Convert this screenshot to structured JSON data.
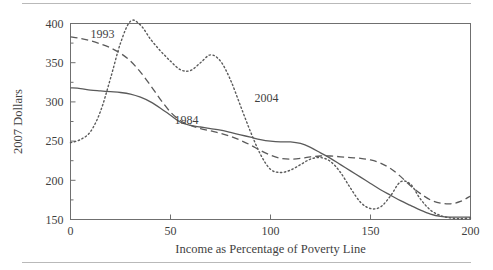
{
  "figure": {
    "name": "poverty-line-income-chart",
    "top_rule": true,
    "bottom_rule": true
  },
  "chart_data": {
    "type": "line",
    "title": "",
    "xlabel": "Income as Percentage of Poverty Line",
    "ylabel": "2007 Dollars",
    "xlim": [
      0,
      200
    ],
    "ylim": [
      150,
      400
    ],
    "xticks": [
      0,
      50,
      100,
      150,
      200
    ],
    "xtick_labels": [
      "0",
      "50",
      "100",
      "150",
      "200"
    ],
    "yticks": [
      150,
      200,
      250,
      300,
      350,
      400
    ],
    "ytick_labels": [
      "150",
      "200",
      "250",
      "300",
      "350",
      "400"
    ],
    "y_minor_ticks": [
      175,
      225,
      275,
      325,
      375
    ],
    "grid": false,
    "legend": "inline-labels",
    "series": [
      {
        "name": "1984",
        "label": "1984",
        "style": "solid",
        "color": "#5a5a5a",
        "label_x": 52,
        "label_y": 272,
        "x": [
          0,
          5,
          10,
          15,
          20,
          25,
          30,
          35,
          40,
          45,
          50,
          55,
          60,
          65,
          70,
          75,
          80,
          85,
          90,
          95,
          100,
          105,
          110,
          115,
          120,
          125,
          130,
          135,
          140,
          145,
          150,
          155,
          160,
          165,
          170,
          175,
          180,
          185,
          190,
          195,
          200
        ],
        "y": [
          318,
          317,
          315,
          314,
          313,
          312,
          310,
          306,
          300,
          292,
          283,
          274,
          270,
          268,
          266,
          264,
          261,
          258,
          255,
          252,
          250,
          249,
          249,
          247,
          242,
          235,
          228,
          220,
          212,
          204,
          196,
          188,
          181,
          174,
          168,
          162,
          157,
          154,
          153,
          153,
          153
        ]
      },
      {
        "name": "1993",
        "label": "1993",
        "style": "dashed",
        "color": "#5a5a5a",
        "label_x": 10,
        "label_y": 381,
        "x": [
          0,
          5,
          10,
          15,
          20,
          25,
          30,
          35,
          40,
          45,
          50,
          55,
          60,
          65,
          70,
          75,
          80,
          85,
          90,
          95,
          100,
          105,
          110,
          115,
          120,
          125,
          130,
          135,
          140,
          145,
          150,
          155,
          160,
          165,
          170,
          175,
          180,
          185,
          190,
          195,
          200
        ],
        "y": [
          383,
          381,
          378,
          374,
          369,
          362,
          352,
          338,
          321,
          303,
          287,
          276,
          270,
          266,
          263,
          260,
          256,
          251,
          245,
          238,
          232,
          228,
          227,
          228,
          230,
          231,
          231,
          230,
          229,
          228,
          226,
          222,
          215,
          205,
          193,
          183,
          175,
          171,
          170,
          173,
          180
        ]
      },
      {
        "name": "2004",
        "label": "2004",
        "style": "dotted",
        "color": "#5a5a5a",
        "label_x": 92,
        "label_y": 300,
        "x": [
          0,
          5,
          10,
          15,
          20,
          25,
          30,
          35,
          40,
          45,
          50,
          55,
          60,
          65,
          70,
          75,
          80,
          85,
          90,
          95,
          100,
          105,
          110,
          115,
          120,
          125,
          130,
          135,
          140,
          145,
          150,
          155,
          160,
          165,
          170,
          175,
          180,
          185,
          190,
          195,
          200
        ],
        "y": [
          248,
          252,
          262,
          288,
          330,
          375,
          403,
          398,
          380,
          365,
          352,
          341,
          340,
          350,
          360,
          352,
          328,
          295,
          262,
          233,
          214,
          210,
          213,
          220,
          227,
          229,
          224,
          210,
          190,
          172,
          164,
          166,
          180,
          198,
          195,
          176,
          162,
          155,
          152,
          151,
          152
        ]
      }
    ]
  }
}
